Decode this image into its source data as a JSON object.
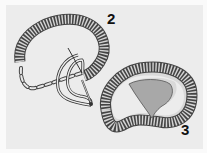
{
  "diagram": {
    "steps": [
      {
        "number": "2",
        "label_pos": {
          "x": 107,
          "y": 12
        }
      },
      {
        "number": "3",
        "label_pos": {
          "x": 181,
          "y": 123
        }
      }
    ],
    "colors": {
      "background": "#ececec",
      "segment_fill": "#d4d4d4",
      "segment_stroke": "#444444",
      "inner_light": "#d9d9d9",
      "inner_dark": "#a8a8a8",
      "line": "#333333"
    }
  }
}
